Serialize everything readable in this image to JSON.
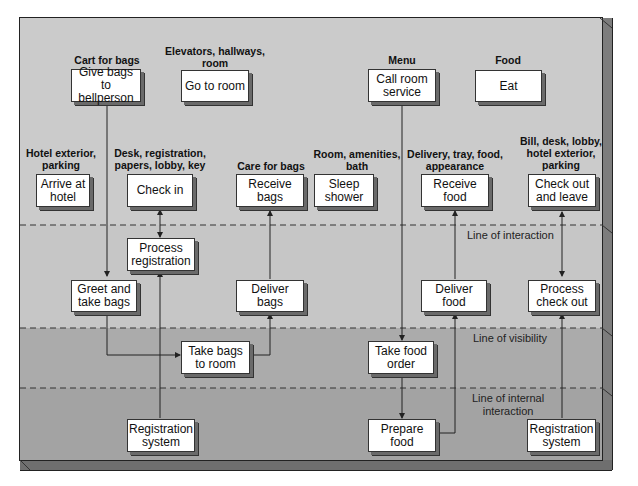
{
  "diagram": {
    "type": "service-blueprint"
  },
  "lines": {
    "interaction": "Line of interaction",
    "visibility": "Line of visibility",
    "internal": "Line of internal interaction",
    "internal_line1": "Line of internal",
    "internal_line2": "interaction"
  },
  "physical_evidence": {
    "cart": "Cart for bags",
    "elevators_l1": "Elevators, hallways,",
    "elevators_l2": "room",
    "menu": "Menu",
    "food": "Food",
    "exterior_l1": "Hotel exterior,",
    "exterior_l2": "parking",
    "desk_l1": "Desk, registration,",
    "desk_l2": "papers, lobby, key",
    "care_bags": "Care for bags",
    "room_l1": "Room, amenities,",
    "room_l2": "bath",
    "delivery_l1": "Delivery, tray, food,",
    "delivery_l2": "appearance",
    "bill_l1": "Bill, desk, lobby,",
    "bill_l2": "hotel exterior,",
    "bill_l3": "parking"
  },
  "customer_actions": {
    "give_bags": "Give bags to bellperson",
    "go_to_room": "Go to room",
    "call_room_service": "Call room service",
    "eat": "Eat",
    "arrive": "Arrive at hotel",
    "check_in": "Check in",
    "receive_bags": "Receive bags",
    "sleep": "Sleep shower",
    "receive_food": "Receive food",
    "check_out": "Check out and leave"
  },
  "onstage_actions": {
    "process_registration": "Process registration",
    "greet": "Greet and take bags",
    "deliver_bags": "Deliver bags",
    "deliver_food": "Deliver food",
    "process_checkout": "Process check out"
  },
  "backstage_actions": {
    "take_bags_room": "Take bags to room",
    "take_food_order": "Take food order"
  },
  "support_processes": {
    "registration_system_1": "Registration system",
    "prepare_food": "Prepare food",
    "registration_system_2": "Registration system"
  },
  "colors": {
    "zone_top": "#cbcbcb",
    "zone_onstage": "#c6c6c6",
    "zone_backstage": "#ababab",
    "zone_support": "#a3a3a3",
    "box": "#ffffff",
    "line": "#333333"
  }
}
